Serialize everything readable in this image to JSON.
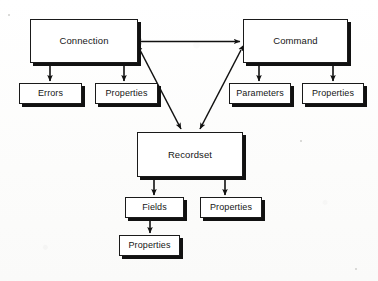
{
  "diagram": {
    "type": "object-model-diagram",
    "background_color": "#fdfdfc",
    "box_fill_color": "#ffffff",
    "box_border_color": "#1a1a1a",
    "box_shadow_color": "#111111",
    "arrow_color": "#111111",
    "nodes": [
      {
        "id": "connection",
        "label": "Connection",
        "level": "primary",
        "x": 30,
        "y": 19,
        "w": 108,
        "h": 44
      },
      {
        "id": "errors",
        "label": "Errors",
        "level": "secondary",
        "x": 19,
        "y": 83,
        "w": 63,
        "h": 21
      },
      {
        "id": "connection-properties",
        "label": "Properties",
        "level": "secondary",
        "x": 95,
        "y": 83,
        "w": 63,
        "h": 21
      },
      {
        "id": "command",
        "label": "Command",
        "level": "primary",
        "x": 243,
        "y": 19,
        "w": 105,
        "h": 44
      },
      {
        "id": "parameters",
        "label": "Parameters",
        "level": "secondary",
        "x": 229,
        "y": 83,
        "w": 62,
        "h": 21
      },
      {
        "id": "command-properties",
        "label": "Properties",
        "level": "secondary",
        "x": 302,
        "y": 83,
        "w": 62,
        "h": 21
      },
      {
        "id": "recordset",
        "label": "Recordset",
        "level": "primary",
        "x": 137,
        "y": 132,
        "w": 106,
        "h": 45
      },
      {
        "id": "fields",
        "label": "Fields",
        "level": "secondary",
        "x": 125,
        "y": 197,
        "w": 59,
        "h": 21
      },
      {
        "id": "recordset-properties",
        "label": "Properties",
        "level": "secondary",
        "x": 200,
        "y": 197,
        "w": 62,
        "h": 21
      },
      {
        "id": "fields-properties",
        "label": "Properties",
        "level": "secondary",
        "x": 119,
        "y": 235,
        "w": 61,
        "h": 21
      }
    ],
    "edges": [
      {
        "id": "connection-command",
        "from": "connection",
        "to": "command",
        "style": "double-arrow",
        "orientation": "horizontal"
      },
      {
        "id": "connection-recordset",
        "from": "connection",
        "to": "recordset",
        "style": "double-arrow",
        "orientation": "diagonal"
      },
      {
        "id": "command-recordset",
        "from": "command",
        "to": "recordset",
        "style": "double-arrow",
        "orientation": "diagonal"
      },
      {
        "id": "connection-errors",
        "from": "connection",
        "to": "errors",
        "style": "single-arrow",
        "orientation": "vertical"
      },
      {
        "id": "connection-properties",
        "from": "connection",
        "to": "connection-properties",
        "style": "single-arrow",
        "orientation": "vertical"
      },
      {
        "id": "command-parameters",
        "from": "command",
        "to": "parameters",
        "style": "single-arrow",
        "orientation": "vertical"
      },
      {
        "id": "command-properties",
        "from": "command",
        "to": "command-properties",
        "style": "single-arrow",
        "orientation": "vertical"
      },
      {
        "id": "recordset-fields",
        "from": "recordset",
        "to": "fields",
        "style": "single-arrow",
        "orientation": "vertical"
      },
      {
        "id": "recordset-properties",
        "from": "recordset",
        "to": "recordset-properties",
        "style": "single-arrow",
        "orientation": "vertical"
      },
      {
        "id": "fields-properties",
        "from": "fields",
        "to": "fields-properties",
        "style": "single-arrow",
        "orientation": "vertical"
      }
    ]
  }
}
